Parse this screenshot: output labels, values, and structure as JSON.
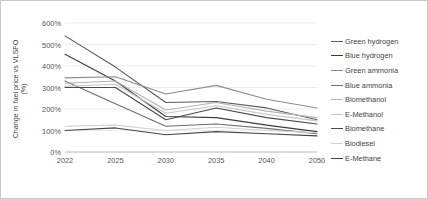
{
  "chart_data": {
    "type": "line",
    "title": "",
    "xlabel": "",
    "ylabel": "Change in fuel price vs VLSFO (%)",
    "ylabel_line1": "Change in fuel price vs VLSFO",
    "ylabel_line2": "(%)",
    "categories": [
      "2022",
      "2025",
      "2030",
      "2035",
      "2040",
      "2050"
    ],
    "ylim": [
      0,
      600
    ],
    "ytick_values": [
      0,
      100,
      200,
      300,
      400,
      500,
      600
    ],
    "ytick_labels": [
      "0%",
      "100%",
      "200%",
      "300%",
      "400%",
      "500%",
      "600%"
    ],
    "grid": "horizontal",
    "legend_position": "right",
    "series": [
      {
        "name": "Green hydrogen",
        "color": "#5a5a5a",
        "values": [
          540,
          395,
          230,
          235,
          205,
          150
        ]
      },
      {
        "name": "Blue hydrogen",
        "color": "#3c3c3c",
        "values": [
          455,
          330,
          165,
          160,
          125,
          95
        ]
      },
      {
        "name": "Green ammonia",
        "color": "#8c8c8c",
        "values": [
          345,
          350,
          270,
          310,
          245,
          205
        ]
      },
      {
        "name": "Blue ammonia",
        "color": "#6e6e6e",
        "values": [
          330,
          225,
          120,
          130,
          110,
          85
        ]
      },
      {
        "name": "Biomethanol",
        "color": "#b4b4b4",
        "values": [
          320,
          330,
          195,
          230,
          190,
          160
        ]
      },
      {
        "name": "E-Methanol",
        "color": "#c8c8c8",
        "values": [
          305,
          315,
          180,
          215,
          175,
          145
        ]
      },
      {
        "name": "Biomethane",
        "color": "#4a4a4a",
        "values": [
          300,
          300,
          150,
          205,
          160,
          130
        ]
      },
      {
        "name": "Biodiesel",
        "color": "#d2d2d2",
        "values": [
          120,
          125,
          100,
          115,
          100,
          90
        ]
      },
      {
        "name": "E-Methane",
        "color": "#454545",
        "values": [
          100,
          112,
          80,
          95,
          85,
          75
        ]
      }
    ]
  },
  "legend": {
    "items": [
      {
        "label": "Green hydrogen"
      },
      {
        "label": "Blue hydrogen"
      },
      {
        "label": "Green ammonia"
      },
      {
        "label": "Blue ammonia"
      },
      {
        "label": "Biomethanol"
      },
      {
        "label": "E-Methanol"
      },
      {
        "label": "Biomethane"
      },
      {
        "label": "Biodiesel"
      },
      {
        "label": "E-Methane"
      }
    ]
  }
}
